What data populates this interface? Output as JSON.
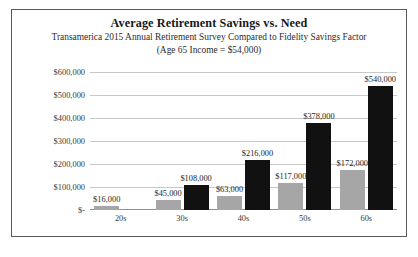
{
  "chart_data": {
    "type": "bar",
    "title": "Average Retirement Savings vs. Need",
    "subtitle_line1": "Transamerica 2015 Annual Retirement Survey Compared to Fidelity Savings Factor",
    "subtitle_line2": "(Age 65 Income = $54,000)",
    "xlabel": "",
    "ylabel": "",
    "categories": [
      "20s",
      "30s",
      "40s",
      "50s",
      "60s"
    ],
    "ylim": [
      0,
      600000
    ],
    "ytick_values": [
      0,
      100000,
      200000,
      300000,
      400000,
      500000,
      600000
    ],
    "ytick_labels": [
      "$-",
      "$100,000",
      "$200,000",
      "$300,000",
      "$400,000",
      "$500,000",
      "$600,000"
    ],
    "grid": true,
    "legend": "none",
    "series": [
      {
        "name": "Average Retirement Savings",
        "color": "#a6a6a6",
        "values": [
          16000,
          45000,
          63000,
          117000,
          172000
        ],
        "data_labels": [
          "$16,000",
          "$45,000",
          "$63,000",
          "$117,000",
          "$172,000"
        ]
      },
      {
        "name": "Savings Need",
        "color": "#111111",
        "values": [
          null,
          108000,
          216000,
          378000,
          540000
        ],
        "data_labels": [
          "",
          "$108,000",
          "$216,000",
          "$378,000",
          "$540,000"
        ]
      }
    ]
  },
  "colors": {
    "border": "#5a5a5a",
    "gridline": "#c8c8c8",
    "baseline": "#8f8f8f",
    "background": "#ffffff",
    "text": "#1f1f22"
  }
}
